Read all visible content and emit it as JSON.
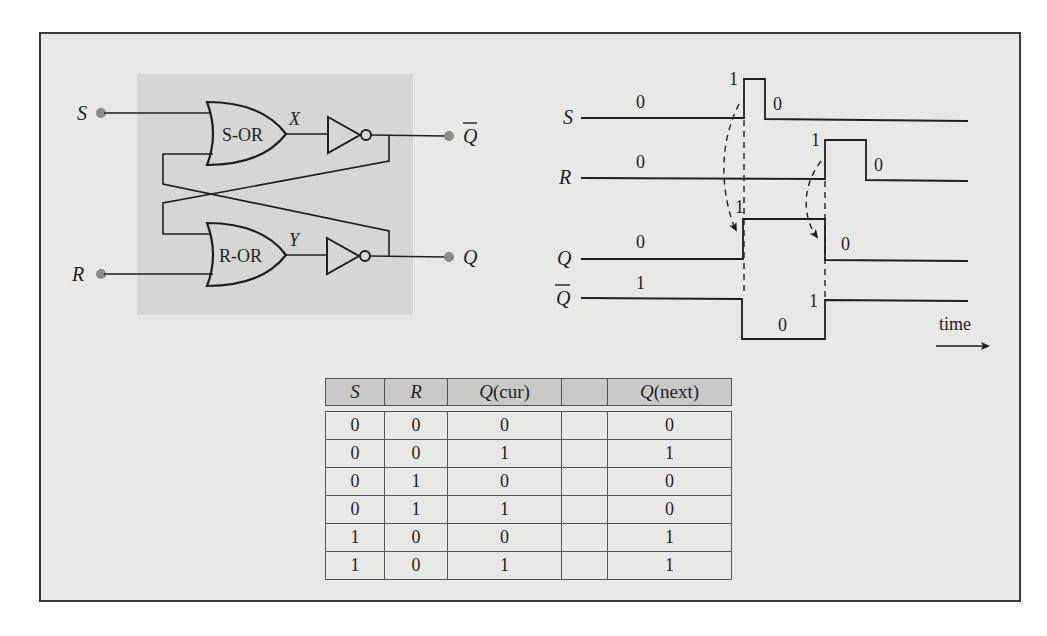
{
  "circuit": {
    "inputs": {
      "s_label": "S",
      "r_label": "R"
    },
    "gates": {
      "top_or_label": "S-OR",
      "bottom_or_label": "R-OR"
    },
    "intermediate": {
      "x_label": "X",
      "y_label": "Y"
    },
    "outputs": {
      "qbar_label": "Q",
      "q_label": "Q"
    },
    "colors": {
      "panel_bg": "#d6d6d5",
      "terminal_dot": "#8a8a8a",
      "wire": "#1f1f1f"
    }
  },
  "timing": {
    "signals": [
      {
        "name": "S",
        "overline": false,
        "before": "0",
        "pulse": "1",
        "after": "0"
      },
      {
        "name": "R",
        "overline": false,
        "before": "0",
        "pulse": "1",
        "after": "0"
      },
      {
        "name": "Q",
        "overline": false,
        "before": "0",
        "mid": "1",
        "after": "0"
      },
      {
        "name": "Q",
        "overline": true,
        "before": "1",
        "mid": "0",
        "after": "1"
      }
    ],
    "axis_label": "time"
  },
  "truth_table": {
    "headers": {
      "s": "S",
      "r": "R",
      "qcur_sym": "Q",
      "qcur_suffix": "(cur)",
      "blank": "",
      "qnext_sym": "Q",
      "qnext_suffix": "(next)"
    },
    "rows": [
      {
        "s": "0",
        "r": "0",
        "qcur": "0",
        "blank": "",
        "qnext": "0"
      },
      {
        "s": "0",
        "r": "0",
        "qcur": "1",
        "blank": "",
        "qnext": "1"
      },
      {
        "s": "0",
        "r": "1",
        "qcur": "0",
        "blank": "",
        "qnext": "0"
      },
      {
        "s": "0",
        "r": "1",
        "qcur": "1",
        "blank": "",
        "qnext": "0"
      },
      {
        "s": "1",
        "r": "0",
        "qcur": "0",
        "blank": "",
        "qnext": "1"
      },
      {
        "s": "1",
        "r": "0",
        "qcur": "1",
        "blank": "",
        "qnext": "1"
      }
    ]
  }
}
